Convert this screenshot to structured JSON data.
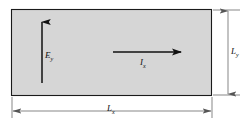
{
  "figure": {
    "name": "rectangular-slab-hall-effect-diagram",
    "background_color": "#ffffff"
  },
  "slab": {
    "fill_color": "#d6d6d6",
    "stroke_color": "#1a1a1a",
    "x": 11,
    "y": 9,
    "width": 201,
    "height": 87
  },
  "vectors": [
    {
      "id": "field-vector",
      "label_symbol": "E",
      "label_subscript": "y",
      "direction": "up",
      "x": 42,
      "y_start": 83,
      "y_end": 20,
      "color": "#111111"
    },
    {
      "id": "current-vector",
      "label_symbol": "I",
      "label_subscript": "x",
      "direction": "right",
      "y": 52,
      "x_start": 113,
      "x_end": 184,
      "color": "#111111"
    }
  ],
  "dimensions": [
    {
      "id": "width-dimension",
      "label_symbol": "L",
      "label_subscript": "x",
      "orientation": "horizontal",
      "line_y": 111,
      "x_start": 12,
      "x_end": 212,
      "color": "#555555"
    },
    {
      "id": "height-dimension",
      "label_symbol": "L",
      "label_subscript": "y",
      "orientation": "vertical",
      "line_x": 228,
      "y_start": 10,
      "y_end": 95,
      "color": "#555555"
    }
  ],
  "labels": {
    "field": {
      "symbol": "E",
      "subscript": "y"
    },
    "current": {
      "symbol": "I",
      "subscript": "x"
    },
    "width": {
      "symbol": "L",
      "subscript": "x"
    },
    "height": {
      "symbol": "L",
      "subscript": "y"
    }
  }
}
